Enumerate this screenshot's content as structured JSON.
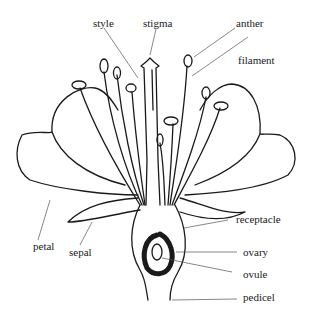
{
  "diagram": {
    "labels": [
      {
        "id": "style",
        "text": "style"
      },
      {
        "id": "stigma",
        "text": "stigma"
      },
      {
        "id": "anther",
        "text": "anther"
      },
      {
        "id": "filament",
        "text": "filament"
      },
      {
        "id": "receptacle",
        "text": "receptacle"
      },
      {
        "id": "ovary",
        "text": "ovary"
      },
      {
        "id": "ovule",
        "text": "ovule"
      },
      {
        "id": "pedicel",
        "text": "pedicel"
      },
      {
        "id": "petal",
        "text": "petal"
      },
      {
        "id": "sepal",
        "text": "sepal"
      }
    ]
  }
}
